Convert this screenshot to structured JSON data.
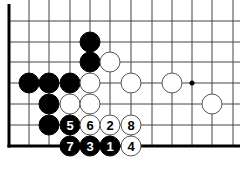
{
  "diagram": {
    "type": "go-board-fragment",
    "grid": {
      "cols_x": [
        9,
        29,
        49,
        70,
        90,
        110,
        131,
        152,
        172,
        192,
        212,
        233
      ],
      "rows_y": [
        0,
        21,
        42,
        62,
        83,
        104,
        125,
        146
      ],
      "left_edge_x": 9,
      "bottom_edge_y": 146,
      "right_extent_x": 240,
      "line_color": "#444444",
      "edge_color": "#000000"
    },
    "star_points": [
      {
        "x": 192,
        "y": 83
      }
    ],
    "stones": [
      {
        "color": "black",
        "x": 90,
        "y": 42,
        "label": ""
      },
      {
        "color": "black",
        "x": 90,
        "y": 62,
        "label": ""
      },
      {
        "color": "white",
        "x": 110,
        "y": 62,
        "label": ""
      },
      {
        "color": "black",
        "x": 29,
        "y": 83,
        "label": ""
      },
      {
        "color": "black",
        "x": 49,
        "y": 83,
        "label": ""
      },
      {
        "color": "black",
        "x": 70,
        "y": 83,
        "label": ""
      },
      {
        "color": "white",
        "x": 90,
        "y": 83,
        "label": ""
      },
      {
        "color": "white",
        "x": 131,
        "y": 83,
        "label": ""
      },
      {
        "color": "white",
        "x": 172,
        "y": 83,
        "label": ""
      },
      {
        "color": "black",
        "x": 49,
        "y": 104,
        "label": ""
      },
      {
        "color": "white",
        "x": 70,
        "y": 104,
        "label": ""
      },
      {
        "color": "white",
        "x": 90,
        "y": 104,
        "label": ""
      },
      {
        "color": "white",
        "x": 212,
        "y": 104,
        "label": ""
      },
      {
        "color": "black",
        "x": 49,
        "y": 125,
        "label": ""
      },
      {
        "color": "black",
        "x": 70,
        "y": 125,
        "label": "5"
      },
      {
        "color": "white",
        "x": 90,
        "y": 125,
        "label": "6"
      },
      {
        "color": "white",
        "x": 110,
        "y": 125,
        "label": "2"
      },
      {
        "color": "white",
        "x": 131,
        "y": 125,
        "label": "8"
      },
      {
        "color": "black",
        "x": 70,
        "y": 146,
        "label": "7"
      },
      {
        "color": "black",
        "x": 90,
        "y": 146,
        "label": "3"
      },
      {
        "color": "black",
        "x": 110,
        "y": 146,
        "label": "1"
      },
      {
        "color": "white",
        "x": 131,
        "y": 146,
        "label": "4"
      }
    ],
    "stone_radius": 10,
    "colors": {
      "black": "#000000",
      "white": "#ffffff",
      "stone_outline": "#555555"
    }
  }
}
